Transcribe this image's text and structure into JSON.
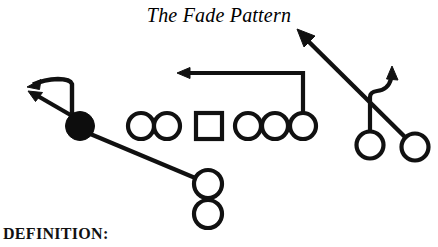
{
  "diagram": {
    "title": "The Fade Pattern",
    "definition_label": "DEFINITION:",
    "type": "football-play-diagram",
    "colors": {
      "ink": "#111111",
      "background": "#ffffff",
      "filled_player": "#0d0d0d"
    },
    "players": [
      {
        "id": "split-end",
        "label": "X",
        "shape": "filled-circle",
        "x": 80,
        "y": 126,
        "r": 14
      },
      {
        "id": "left-tackle",
        "label": "LT",
        "shape": "circle",
        "x": 141,
        "y": 126,
        "r": 13
      },
      {
        "id": "left-guard",
        "label": "LG",
        "shape": "circle",
        "x": 167,
        "y": 126,
        "r": 13
      },
      {
        "id": "center",
        "label": "C",
        "shape": "square",
        "x": 209,
        "y": 126,
        "r": 13
      },
      {
        "id": "right-guard",
        "label": "RG",
        "shape": "circle",
        "x": 248,
        "y": 126,
        "r": 13
      },
      {
        "id": "right-tackle",
        "label": "RT",
        "shape": "circle",
        "x": 275,
        "y": 126,
        "r": 13
      },
      {
        "id": "tight-end",
        "label": "TE",
        "shape": "circle",
        "x": 303,
        "y": 126,
        "r": 13
      },
      {
        "id": "quarterback",
        "label": "QB",
        "shape": "circle",
        "x": 208,
        "y": 184,
        "r": 14
      },
      {
        "id": "running-back",
        "label": "RB",
        "shape": "circle",
        "x": 208,
        "y": 214,
        "r": 14
      },
      {
        "id": "slot-receiver",
        "label": "H",
        "shape": "circle",
        "x": 370,
        "y": 145,
        "r": 13
      },
      {
        "id": "flanker",
        "label": "Z",
        "shape": "circle",
        "x": 415,
        "y": 147,
        "r": 13
      }
    ],
    "routes": [
      {
        "id": "split-end-curl-route",
        "player": "split-end",
        "kind": "curved-arrow",
        "direction": "upfield-then-back-left"
      },
      {
        "id": "split-end-fade-route",
        "player": "split-end",
        "kind": "straight-arrow",
        "direction": "up-left"
      },
      {
        "id": "qb-handoff-line",
        "player": "quarterback",
        "kind": "line",
        "direction": "up-left-to-split-end"
      },
      {
        "id": "tight-end-drag-route",
        "player": "tight-end",
        "kind": "arrow",
        "direction": "up-then-left"
      },
      {
        "id": "slot-hook-route",
        "player": "slot-receiver",
        "kind": "hook-arrow",
        "direction": "up-then-hook-up"
      },
      {
        "id": "flanker-fade-route",
        "player": "flanker",
        "kind": "straight-arrow",
        "direction": "up-left-deep"
      }
    ]
  }
}
